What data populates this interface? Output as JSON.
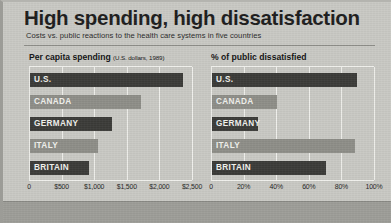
{
  "header": {
    "title": "High spending, high dissatisfaction",
    "subtitle": "Costs vs. public reactions to the health care systems in five countries"
  },
  "colors": {
    "background": "#c9c9c4",
    "bar_dark": "#3b3b38",
    "bar_light": "#8e8e88",
    "gridline": "#f0f0ec",
    "text": "#1d1d1d",
    "bar_label_text": "#f2f2ee",
    "footer_band": "#9d9d98"
  },
  "chart_data": [
    {
      "type": "bar",
      "orientation": "horizontal",
      "panel": "left",
      "title": "Per capita spending",
      "title_unit": "(U.S. dollars, 1989)",
      "categories": [
        "U.S.",
        "CANADA",
        "GERMANY",
        "ITALY",
        "BRITAIN"
      ],
      "values": [
        2350,
        1700,
        1250,
        1050,
        900
      ],
      "bar_styles": [
        "dark",
        "light",
        "dark",
        "light",
        "dark"
      ],
      "xlabel": "",
      "ylabel": "",
      "xlim": [
        0,
        2500
      ],
      "ticks": [
        0,
        500,
        1000,
        1500,
        2000,
        2500
      ],
      "tick_labels": [
        "0",
        "$500",
        "$1,000",
        "$1,500",
        "$2,000",
        "$2,500"
      ],
      "grid": true,
      "legend": "none"
    },
    {
      "type": "bar",
      "orientation": "horizontal",
      "panel": "right",
      "title": "% of public dissatisfied",
      "title_unit": "",
      "categories": [
        "U.S.",
        "CANADA",
        "GERMANY",
        "ITALY",
        "BRITAIN"
      ],
      "values": [
        89,
        40,
        28,
        88,
        70
      ],
      "bar_styles": [
        "dark",
        "light",
        "dark",
        "light",
        "dark"
      ],
      "xlabel": "",
      "ylabel": "",
      "xlim": [
        0,
        100
      ],
      "ticks": [
        0,
        20,
        40,
        60,
        80,
        100
      ],
      "tick_labels": [
        "0",
        "20%",
        "40%",
        "60%",
        "80%",
        "100%"
      ],
      "grid": true,
      "legend": "none"
    }
  ]
}
